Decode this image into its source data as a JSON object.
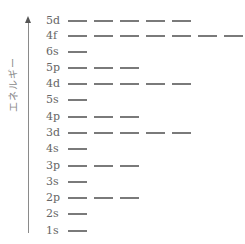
{
  "diagram": {
    "axis_label": "エネルギー",
    "axis_direction": "up",
    "line_color": "#7a7a7a",
    "levels": [
      {
        "label": "5d",
        "orbitals": 5,
        "y": 21
      },
      {
        "label": "4f",
        "orbitals": 7,
        "y": 36
      },
      {
        "label": "6s",
        "orbitals": 1,
        "y": 52
      },
      {
        "label": "5p",
        "orbitals": 3,
        "y": 68
      },
      {
        "label": "4d",
        "orbitals": 5,
        "y": 84
      },
      {
        "label": "5s",
        "orbitals": 1,
        "y": 100
      },
      {
        "label": "4p",
        "orbitals": 3,
        "y": 117
      },
      {
        "label": "3d",
        "orbitals": 5,
        "y": 133
      },
      {
        "label": "4s",
        "orbitals": 1,
        "y": 149
      },
      {
        "label": "3p",
        "orbitals": 3,
        "y": 166
      },
      {
        "label": "3s",
        "orbitals": 1,
        "y": 182
      },
      {
        "label": "2p",
        "orbitals": 3,
        "y": 198
      },
      {
        "label": "2s",
        "orbitals": 1,
        "y": 214
      },
      {
        "label": "1s",
        "orbitals": 1,
        "y": 231
      }
    ]
  }
}
